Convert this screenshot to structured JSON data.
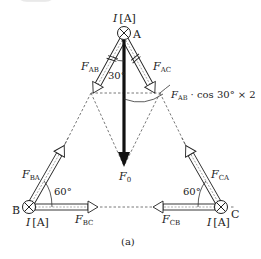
{
  "figure": {
    "caption": "(a)",
    "nodes": {
      "A": {
        "label": "A",
        "current": "I [A]",
        "current_var": "I",
        "current_unit": "[A]",
        "symbol": "current-into-page"
      },
      "B": {
        "label": "B",
        "current": "I [A]",
        "current_var": "I",
        "current_unit": "[A]",
        "symbol": "current-into-page"
      },
      "C": {
        "label": "C",
        "current": "I [A]",
        "current_var": "I",
        "current_unit": "[A]",
        "symbol": "current-into-page"
      }
    },
    "forces": {
      "F_AB": {
        "base": "F",
        "sub": "AB"
      },
      "F_AC": {
        "base": "F",
        "sub": "AC"
      },
      "F_BA": {
        "base": "F",
        "sub": "BA"
      },
      "F_BC": {
        "base": "F",
        "sub": "BC"
      },
      "F_CA": {
        "base": "F",
        "sub": "CA"
      },
      "F_CB": {
        "base": "F",
        "sub": "CB"
      },
      "F_0": {
        "base": "F",
        "sub": "0"
      }
    },
    "angles": {
      "A": "30°",
      "B": "60°",
      "C": "60°"
    },
    "resultant_annotation": {
      "base": "F",
      "sub": "AB",
      "expr": " · cos 30° × 2"
    },
    "colors": {
      "ink": "#222222",
      "dashed": "#555555",
      "arrow_fill": "#ffffff"
    }
  }
}
